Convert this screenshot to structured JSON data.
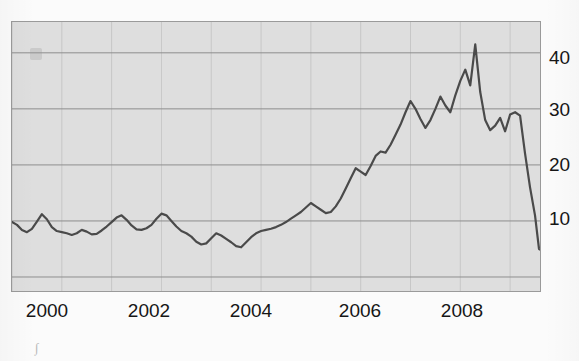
{
  "chart_data": {
    "type": "line",
    "title": "",
    "subtitle": "",
    "xlabel": "",
    "ylabel": "",
    "xlim": [
      1999.0,
      2009.6
    ],
    "ylim": [
      -2.5,
      45.5
    ],
    "xticks": [
      2000,
      2002,
      2004,
      2006,
      2008
    ],
    "xtick_labels": [
      "2000",
      "2002",
      "2004",
      "2006",
      "2008"
    ],
    "yticks": [
      0,
      10,
      20,
      30,
      40
    ],
    "ytick_labels": [
      "10",
      "20",
      "30",
      "40"
    ],
    "ytick_labels_shown": [
      10,
      20,
      30,
      40
    ],
    "grid": "both",
    "grid_color": "#8e8e8e",
    "legend": "none",
    "line_color": "#4a4a4a",
    "line_width": 2.2,
    "plot_background": "#dedede",
    "page_background": "#fbfbfb",
    "series": [
      {
        "name": "series-1",
        "x": [
          1999.0,
          1999.1,
          1999.2,
          1999.3,
          1999.4,
          1999.5,
          1999.6,
          1999.7,
          1999.8,
          1999.9,
          2000.0,
          2000.1,
          2000.2,
          2000.3,
          2000.4,
          2000.5,
          2000.6,
          2000.7,
          2000.8,
          2000.9,
          2001.0,
          2001.1,
          2001.2,
          2001.3,
          2001.4,
          2001.5,
          2001.6,
          2001.7,
          2001.8,
          2001.9,
          2002.0,
          2002.1,
          2002.2,
          2002.3,
          2002.4,
          2002.5,
          2002.6,
          2002.7,
          2002.8,
          2002.9,
          2003.0,
          2003.1,
          2003.2,
          2003.3,
          2003.4,
          2003.5,
          2003.6,
          2003.7,
          2003.8,
          2003.9,
          2004.0,
          2004.1,
          2004.2,
          2004.3,
          2004.4,
          2004.5,
          2004.6,
          2004.7,
          2004.8,
          2004.9,
          2005.0,
          2005.1,
          2005.2,
          2005.3,
          2005.4,
          2005.5,
          2005.6,
          2005.7,
          2005.8,
          2005.9,
          2006.0,
          2006.1,
          2006.2,
          2006.3,
          2006.4,
          2006.5,
          2006.6,
          2006.7,
          2006.8,
          2006.9,
          2007.0,
          2007.1,
          2007.2,
          2007.3,
          2007.4,
          2007.5,
          2007.6,
          2007.7,
          2007.8,
          2007.9,
          2008.0,
          2008.1,
          2008.2,
          2008.3,
          2008.4,
          2008.5,
          2008.6,
          2008.7,
          2008.8,
          2008.9,
          2009.0,
          2009.1,
          2009.2,
          2009.3,
          2009.4,
          2009.5
        ],
        "y": [
          9.8,
          9.3,
          8.4,
          8.0,
          8.6,
          9.9,
          11.2,
          10.3,
          8.9,
          8.2,
          8.0,
          7.8,
          7.5,
          7.8,
          8.4,
          8.1,
          7.6,
          7.7,
          8.3,
          9.0,
          9.8,
          10.6,
          11.0,
          10.2,
          9.2,
          8.5,
          8.4,
          8.7,
          9.3,
          10.4,
          11.3,
          11.0,
          10.0,
          9.0,
          8.2,
          7.8,
          7.2,
          6.3,
          5.8,
          6.0,
          6.9,
          7.8,
          7.4,
          6.8,
          6.2,
          5.5,
          5.3,
          6.2,
          7.1,
          7.8,
          8.2,
          8.4,
          8.6,
          8.9,
          9.3,
          9.8,
          10.4,
          11.0,
          11.6,
          12.4,
          13.2,
          12.6,
          12.0,
          11.4,
          11.6,
          12.6,
          14.0,
          15.8,
          17.6,
          19.4,
          18.8,
          18.2,
          19.8,
          21.6,
          22.4,
          22.2,
          23.6,
          25.4,
          27.2,
          29.4,
          31.4,
          30.0,
          28.2,
          26.6,
          28.0,
          30.0,
          32.2,
          30.6,
          29.4,
          32.4,
          35.0,
          37.0,
          34.2,
          41.5,
          33.0,
          28.0,
          26.2,
          27.0,
          28.4,
          26.0,
          29.0,
          29.4,
          28.8,
          22.0,
          16.0,
          11.0
        ]
      },
      {
        "name": "series-1-tail",
        "x": [
          2009.5,
          2009.58,
          2009.66,
          2009.74,
          2009.82,
          2009.9,
          2009.98,
          2010.06,
          2010.14,
          2010.22,
          2010.3,
          2010.38,
          2010.46,
          2010.54,
          2010.62,
          2010.7
        ],
        "y": [
          11.0,
          5.0,
          4.6,
          5.8,
          4.9,
          3.4,
          5.0,
          6.8,
          6.0,
          7.0,
          9.2,
          12.2,
          10.4,
          9.0,
          11.4,
          8.0
        ]
      }
    ],
    "annotations": [],
    "observations": {
      "start_level": 9.8,
      "trough_2003": 5.3,
      "peak_value": 41.5,
      "peak_year": 2008.5,
      "crash_low": 3.4,
      "end_value": 8.0
    }
  },
  "axis": {
    "x_labels": [
      {
        "text": "2000",
        "x_px": 47
      },
      {
        "text": "2002",
        "x_px": 149
      },
      {
        "text": "2004",
        "x_px": 251
      },
      {
        "text": "2006",
        "x_px": 360
      },
      {
        "text": "2008",
        "x_px": 462
      }
    ],
    "y_labels": [
      {
        "text": "40",
        "y_px": 58
      },
      {
        "text": "30",
        "y_px": 110
      },
      {
        "text": "20",
        "y_px": 165
      },
      {
        "text": "10",
        "y_px": 219
      }
    ]
  }
}
